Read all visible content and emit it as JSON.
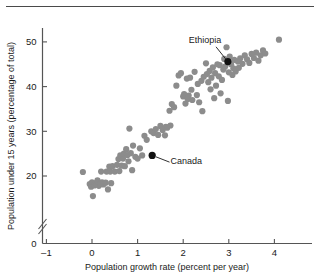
{
  "chart_data": {
    "type": "scatter",
    "title": "",
    "xlabel": "Population growth rate (percent per year)",
    "ylabel": "Population under 15 years (percentage of total)",
    "xlim": [
      -1.15,
      4.6
    ],
    "ylim": [
      14,
      52
    ],
    "xticks": [
      -1,
      0,
      1,
      2,
      3,
      4
    ],
    "xticklabels": [
      "–1",
      "0",
      "1",
      "2",
      "3",
      "4"
    ],
    "yticks": [
      0,
      20,
      30,
      40,
      50
    ],
    "yticklabels": [
      "0",
      "20",
      "30",
      "40",
      "50"
    ],
    "y_axis_break": true,
    "grid": false,
    "legend": null,
    "marker_color": "#8c8c8c",
    "highlight_color": "#111111",
    "points": [
      [
        -0.2,
        20.9
      ],
      [
        -0.05,
        18.2
      ],
      [
        -0.02,
        17.6
      ],
      [
        0.0,
        18.6
      ],
      [
        0.02,
        15.5
      ],
      [
        0.05,
        17.9
      ],
      [
        0.08,
        18.4
      ],
      [
        0.1,
        18.1
      ],
      [
        0.12,
        19.0
      ],
      [
        0.15,
        17.8
      ],
      [
        0.18,
        18.3
      ],
      [
        0.2,
        21.0
      ],
      [
        0.22,
        18.6
      ],
      [
        0.25,
        18.1
      ],
      [
        0.3,
        18.5
      ],
      [
        0.32,
        21.0
      ],
      [
        0.35,
        17.0
      ],
      [
        0.38,
        22.1
      ],
      [
        0.4,
        21.0
      ],
      [
        0.42,
        18.4
      ],
      [
        0.45,
        22.2
      ],
      [
        0.5,
        21.0
      ],
      [
        0.55,
        22.5
      ],
      [
        0.58,
        23.8
      ],
      [
        0.6,
        21.1
      ],
      [
        0.62,
        24.6
      ],
      [
        0.65,
        22.3
      ],
      [
        0.68,
        23.9
      ],
      [
        0.7,
        25.0
      ],
      [
        0.72,
        22.2
      ],
      [
        0.75,
        26.0
      ],
      [
        0.78,
        24.7
      ],
      [
        0.8,
        23.3
      ],
      [
        0.82,
        30.6
      ],
      [
        0.85,
        25.1
      ],
      [
        0.88,
        21.3
      ],
      [
        0.9,
        26.8
      ],
      [
        0.95,
        24.3
      ],
      [
        1.0,
        23.9
      ],
      [
        1.05,
        26.2
      ],
      [
        1.1,
        24.6
      ],
      [
        1.15,
        29.0
      ],
      [
        1.2,
        28.1
      ],
      [
        1.3,
        30.0
      ],
      [
        1.35,
        29.6
      ],
      [
        1.4,
        30.5
      ],
      [
        1.45,
        29.2
      ],
      [
        1.5,
        31.2
      ],
      [
        1.55,
        30.3
      ],
      [
        1.6,
        29.1
      ],
      [
        1.62,
        31.0
      ],
      [
        1.65,
        30.8
      ],
      [
        1.7,
        34.6
      ],
      [
        1.72,
        31.3
      ],
      [
        1.75,
        36.1
      ],
      [
        1.8,
        35.4
      ],
      [
        1.85,
        40.2
      ],
      [
        1.9,
        42.5
      ],
      [
        1.95,
        43.0
      ],
      [
        2.0,
        37.8
      ],
      [
        2.02,
        38.3
      ],
      [
        2.05,
        36.2
      ],
      [
        2.08,
        41.8
      ],
      [
        2.1,
        37.2
      ],
      [
        2.12,
        38.0
      ],
      [
        2.15,
        42.0
      ],
      [
        2.18,
        39.3
      ],
      [
        2.2,
        37.0
      ],
      [
        2.25,
        43.3
      ],
      [
        2.3,
        38.1
      ],
      [
        2.32,
        40.6
      ],
      [
        2.35,
        36.5
      ],
      [
        2.4,
        41.3
      ],
      [
        2.42,
        34.5
      ],
      [
        2.45,
        42.2
      ],
      [
        2.5,
        45.2
      ],
      [
        2.52,
        42.8
      ],
      [
        2.55,
        41.0
      ],
      [
        2.58,
        43.5
      ],
      [
        2.6,
        39.4
      ],
      [
        2.62,
        42.0
      ],
      [
        2.65,
        44.3
      ],
      [
        2.68,
        37.4
      ],
      [
        2.7,
        43.0
      ],
      [
        2.72,
        40.2
      ],
      [
        2.75,
        45.0
      ],
      [
        2.78,
        42.3
      ],
      [
        2.8,
        44.8
      ],
      [
        2.82,
        38.5
      ],
      [
        2.85,
        41.5
      ],
      [
        2.88,
        43.8
      ],
      [
        2.9,
        46.2
      ],
      [
        2.92,
        44.5
      ],
      [
        2.95,
        48.8
      ],
      [
        2.98,
        36.8
      ],
      [
        3.0,
        43.2
      ],
      [
        3.02,
        46.7
      ],
      [
        3.05,
        45.0
      ],
      [
        3.08,
        42.6
      ],
      [
        3.1,
        44.1
      ],
      [
        3.12,
        46.0
      ],
      [
        3.15,
        43.4
      ],
      [
        3.2,
        45.6
      ],
      [
        3.22,
        44.2
      ],
      [
        3.25,
        46.3
      ],
      [
        3.3,
        45.1
      ],
      [
        3.35,
        47.0
      ],
      [
        3.4,
        46.1
      ],
      [
        3.45,
        45.3
      ],
      [
        3.5,
        47.3
      ],
      [
        3.55,
        46.4
      ],
      [
        3.6,
        47.6
      ],
      [
        3.65,
        45.8
      ],
      [
        3.7,
        47.0
      ],
      [
        3.75,
        48.1
      ],
      [
        3.8,
        47.4
      ],
      [
        4.1,
        50.5
      ]
    ],
    "highlights": [
      {
        "label": "Ethiopia",
        "x": 2.98,
        "y": 45.6,
        "label_x": 2.48,
        "label_y": 49.8,
        "leader": [
          [
            2.72,
            48.9
          ],
          [
            2.93,
            46.2
          ]
        ]
      },
      {
        "label": "Canada",
        "x": 1.32,
        "y": 24.6,
        "label_x": 1.72,
        "label_y": 22.6,
        "leader": [
          [
            1.4,
            24.3
          ],
          [
            1.7,
            23.1
          ]
        ]
      }
    ]
  }
}
